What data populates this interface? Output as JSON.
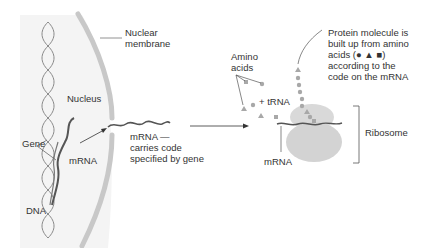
{
  "diagram": {
    "colors": {
      "background": "#ffffff",
      "nucleus_fill": "#f4f4f4",
      "membrane": "#c8c8c8",
      "dna": "#888888",
      "mrna": "#555555",
      "ribosome": "#d6d6d6",
      "amino_acid": "#a8a8a8",
      "text": "#333333",
      "lines": "#555555"
    },
    "labels": {
      "nuclear_membrane": [
        "Nuclear",
        "membrane"
      ],
      "nucleus": "Nucleus",
      "gene": "Gene",
      "mrna_left": "mRNA",
      "dna": "DNA",
      "mrna_caption": [
        "mRNA —",
        "carries code",
        "specified by gene"
      ],
      "amino_acids": [
        "Amino",
        "acids"
      ],
      "trna": "+ tRNA",
      "protein_caption": [
        "Protein molecule is",
        "built up from amino",
        "acids (● ▲ ■)",
        "according to the",
        "code on the mRNA"
      ],
      "ribosome": "Ribosome",
      "mrna_bottom": "mRNA"
    },
    "amino_acid_symbols": [
      "circle",
      "triangle",
      "square"
    ]
  }
}
